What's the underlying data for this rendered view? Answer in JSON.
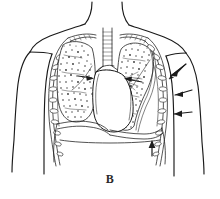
{
  "figure": {
    "panel_label": "B",
    "caption_position": "bottom-center",
    "background_color": "#ffffff",
    "ink_color": "#1a1a1a",
    "style": "black-and-white line drawing"
  },
  "anatomy": {
    "parts": [
      {
        "name": "neck",
        "label": "neck"
      },
      {
        "name": "left-shoulder",
        "label": "shoulder"
      },
      {
        "name": "right-shoulder",
        "label": "shoulder"
      },
      {
        "name": "left-arm",
        "label": "upper arm"
      },
      {
        "name": "right-arm",
        "label": "upper arm"
      },
      {
        "name": "trachea",
        "label": "trachea"
      },
      {
        "name": "right-main-bronchus",
        "label": "main bronchus"
      },
      {
        "name": "left-main-bronchus",
        "label": "main bronchus"
      },
      {
        "name": "right-lung",
        "label": "right lung"
      },
      {
        "name": "left-lung-collapsed",
        "label": "collapsed left lung"
      },
      {
        "name": "heart-mediastinum",
        "label": "heart / mediastinum"
      },
      {
        "name": "diaphragm",
        "label": "diaphragm"
      },
      {
        "name": "rib-cage",
        "label": "rib cage"
      },
      {
        "name": "pleural-space",
        "label": "pleural space"
      }
    ]
  },
  "annotations": {
    "arrows": [
      {
        "name": "chest-wall-arrow-upper",
        "direction": "left-inward",
        "x": 176,
        "y": 74
      },
      {
        "name": "chest-wall-arrow-middle",
        "direction": "left-inward",
        "x": 180,
        "y": 93
      },
      {
        "name": "chest-wall-arrow-lower",
        "direction": "left-inward",
        "x": 180,
        "y": 113
      },
      {
        "name": "diaphragm-arrow",
        "direction": "up",
        "x": 152,
        "y": 146
      },
      {
        "name": "mediastinum-shift-arrow-right",
        "direction": "right",
        "x": 90,
        "y": 78
      },
      {
        "name": "mediastinum-shift-arrow-left",
        "direction": "left",
        "x": 130,
        "y": 80
      }
    ]
  }
}
